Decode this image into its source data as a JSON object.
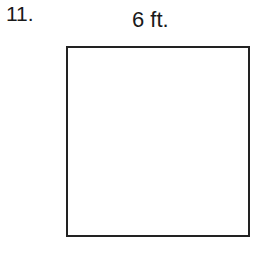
{
  "problem": {
    "number": "11.",
    "side_label": "6 ft.",
    "shape": "square",
    "side_length": 6,
    "unit": "ft.",
    "stroke_color": "#222222"
  }
}
